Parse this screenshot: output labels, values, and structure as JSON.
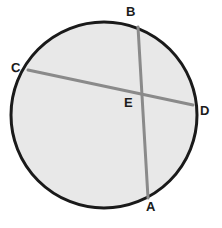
{
  "figure": {
    "kind": "geometry-diagram",
    "canvas": {
      "width": 222,
      "height": 228
    },
    "background_color": "#ffffff"
  },
  "colors": {
    "circle_fill": "#e8e8e8",
    "circle_stroke": "#1a1a1a",
    "chord_stroke": "#8a8a8a",
    "label_color": "#1b1b1b"
  },
  "circle": {
    "name": "circle",
    "center_x": 104,
    "center_y": 115,
    "radius": 93,
    "stroke_width": 3,
    "fill": "#e8e8e8",
    "stroke": "#1a1a1a"
  },
  "chords": [
    {
      "id": "chord-AB",
      "from": "B",
      "to": "A",
      "x1": 138,
      "y1": 27,
      "x2": 148,
      "y2": 198,
      "stroke": "#8a8a8a",
      "stroke_width": 3
    },
    {
      "id": "chord-CD",
      "from": "C",
      "to": "D",
      "x1": 28,
      "y1": 70,
      "x2": 193,
      "y2": 105,
      "stroke": "#8a8a8a",
      "stroke_width": 3
    }
  ],
  "points": {
    "A": {
      "label": "A",
      "x": 148,
      "y": 198,
      "role": "chord-endpoint-on-circle"
    },
    "B": {
      "label": "B",
      "x": 138,
      "y": 27,
      "role": "chord-endpoint-on-circle"
    },
    "C": {
      "label": "C",
      "x": 28,
      "y": 70,
      "role": "chord-endpoint-on-circle"
    },
    "D": {
      "label": "D",
      "x": 193,
      "y": 105,
      "role": "chord-endpoint-on-circle"
    },
    "E": {
      "label": "E",
      "x": 142,
      "y": 95,
      "role": "chord-intersection-interior"
    }
  }
}
